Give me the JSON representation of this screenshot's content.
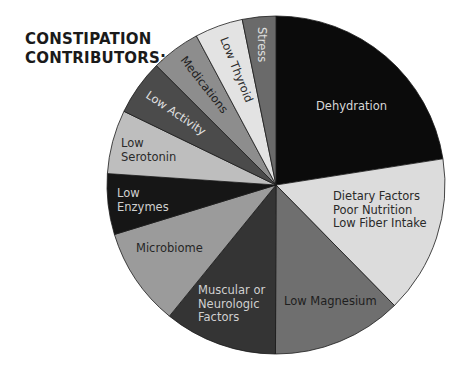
{
  "title_lines": [
    "CONSTIPATION",
    "CONTRIBUTORS:"
  ],
  "chart_data": {
    "type": "pie",
    "title": "CONSTIPATION CONTRIBUTORS:",
    "start_angle_deg": 0,
    "direction": "clockwise",
    "legend": "none (labels inside slices)",
    "unit": "percent (estimated from slice angles)",
    "slices": [
      {
        "label": "Dehydration",
        "lines": [
          "Dehydration"
        ],
        "value": 22.5,
        "color": "#0b0b0b",
        "text_color": "#d8d8d8",
        "label_pos": [
          316,
          110
        ],
        "rotate": 0
      },
      {
        "label": "Dietary Factors / Poor Nutrition / Low Fiber Intake",
        "lines": [
          "Dietary Factors",
          "Poor Nutrition",
          "Low Fiber Intake"
        ],
        "value": 15.1,
        "color": "#dcdcdc",
        "text_color": "#2a2a2a",
        "label_pos": [
          333,
          200
        ],
        "rotate": 0
      },
      {
        "label": "Low Magnesium",
        "lines": [
          "Low Magnesium"
        ],
        "value": 12.4,
        "color": "#6f6f6f",
        "text_color": "#1e1e1e",
        "label_pos": [
          284,
          305
        ],
        "rotate": 0
      },
      {
        "label": "Muscular or Neurologic Factors",
        "lines": [
          "Muscular or",
          "Neurologic",
          "Factors"
        ],
        "value": 10.8,
        "color": "#343434",
        "text_color": "#d0d0d0",
        "label_pos": [
          198,
          294
        ],
        "rotate": 0
      },
      {
        "label": "Microbiome",
        "lines": [
          "Microbiome"
        ],
        "value": 9.4,
        "color": "#9b9b9b",
        "text_color": "#262626",
        "label_pos": [
          136,
          252
        ],
        "rotate": 0
      },
      {
        "label": "Low Enzymes",
        "lines": [
          "Low",
          "Enzymes"
        ],
        "value": 5.8,
        "color": "#161616",
        "text_color": "#d0d0d0",
        "label_pos": [
          117,
          197
        ],
        "rotate": 0
      },
      {
        "label": "Low Serotonin",
        "lines": [
          "Low",
          "Serotonin"
        ],
        "value": 6.1,
        "color": "#bebebe",
        "text_color": "#2a2a2a",
        "label_pos": [
          121,
          147
        ],
        "rotate": 0
      },
      {
        "label": "Low Activity",
        "lines": [
          "Low Activity"
        ],
        "value": 5.3,
        "color": "#4b4b4b",
        "text_color": "#e0e0e0",
        "label_pos": [
          145,
          97
        ],
        "rotate": 34
      },
      {
        "label": "Medications",
        "lines": [
          "Medications"
        ],
        "value": 4.7,
        "color": "#8d8d8d",
        "text_color": "#1e1e1e",
        "label_pos": [
          180,
          60
        ],
        "rotate": 52
      },
      {
        "label": "Low Thyroid",
        "lines": [
          "Low Thyroid"
        ],
        "value": 4.6,
        "color": "#e3e3e3",
        "text_color": "#2a2a2a",
        "label_pos": [
          220,
          39
        ],
        "rotate": 68
      },
      {
        "label": "Stress",
        "lines": [
          "Stress"
        ],
        "value": 3.2,
        "color": "#6a6a6a",
        "text_color": "#e0e0e0",
        "label_pos": [
          258,
          27
        ],
        "rotate": 90
      }
    ]
  },
  "pie_geometry": {
    "cx": 276,
    "cy": 185,
    "r": 169
  }
}
